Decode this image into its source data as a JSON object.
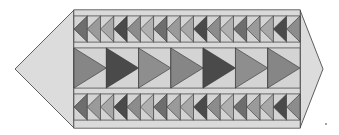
{
  "diagram": {
    "colors": {
      "background": "#d6d6d6",
      "outline": "#3a3a3a",
      "point_fill": "#dcdcdc",
      "shades": [
        "#6e6e6e",
        "#9a9a9a",
        "#a8a8a8",
        "#4a4a4a",
        "#8c8c8c",
        "#b0b0b0"
      ],
      "large_shades": [
        "#868686",
        "#4a4a4a",
        "#8e8e8e"
      ]
    },
    "rows": [
      {
        "name": "top-small-geese-row",
        "count": 17,
        "direction": "left"
      },
      {
        "name": "middle-large-geese-row",
        "count": 7,
        "direction": "right"
      },
      {
        "name": "bottom-small-geese-row",
        "count": 17,
        "direction": "left"
      }
    ],
    "end_points": [
      "left",
      "right"
    ]
  }
}
